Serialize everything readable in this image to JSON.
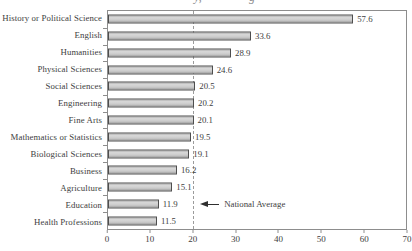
{
  "figure": {
    "width": 412,
    "height": 251,
    "cropped_title_descenders": {
      "left": "y,",
      "right": "g"
    }
  },
  "chart_data": {
    "type": "bar",
    "orientation": "horizontal",
    "categories": [
      "History or Political Science",
      "English",
      "Humanities",
      "Physical Sciences",
      "Social Sciences",
      "Engineering",
      "Fine Arts",
      "Mathematics or Statistics",
      "Biological Sciences",
      "Business",
      "Agriculture",
      "Education",
      "Health Professions"
    ],
    "values": [
      57.6,
      33.6,
      28.9,
      24.6,
      20.5,
      20.2,
      20.1,
      19.5,
      19.1,
      16.2,
      15.1,
      11.9,
      11.5
    ],
    "value_labels": [
      "57.6",
      "33.6",
      "28.9",
      "24.6",
      "20.5",
      "20.2",
      "20.1",
      "19.5",
      "19.1",
      "16.2",
      "15.1",
      "11.9",
      "11.5"
    ],
    "xlim": [
      0,
      70
    ],
    "x_ticks": [
      0,
      10,
      20,
      30,
      40,
      50,
      60,
      70
    ],
    "grid": false,
    "reference_line": {
      "x": 20,
      "style": "dashed",
      "label": "National Average"
    },
    "colors": {
      "bar_fill": "#c9c9c9",
      "bar_border": "#4e4e4e",
      "plot_border": "#8d8d8d",
      "reference_line": "#9b9b9b",
      "text": "#3e3e3e"
    }
  }
}
